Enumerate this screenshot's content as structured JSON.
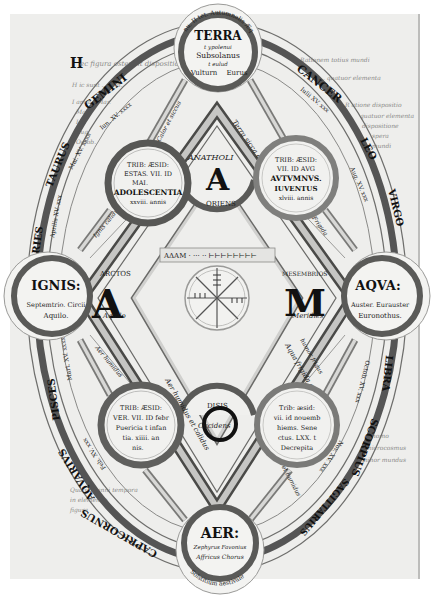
{
  "elements": {
    "terra": {
      "name": "TERRA",
      "lines": [
        "t ypolenui",
        "Subsolanus",
        "t eulud",
        "Vulturn",
        "Eurus"
      ],
      "arc": "nu. II tet. Autumnalis Æquinoctium"
    },
    "ignis": {
      "name": "IGNIS:",
      "lines": [
        "Septemtrio. Circii",
        "Aquilo."
      ],
      "arc": "Ver. Æquinoctium vernale"
    },
    "aqua": {
      "name": "AQVA:",
      "lines": [
        "Auster. Eurauster",
        "Euronothus."
      ],
      "arc": "Solstitium hiemale"
    },
    "aer": {
      "name": "AER:",
      "lines": [
        "Zephyrus Favonius",
        "Affricus Chorus"
      ],
      "arc": "Solstitium aestivale"
    }
  },
  "seasons": {
    "aestas": {
      "lines": [
        "TRIB: ÆSID:",
        "ESTAS. VII. ID",
        "MAI.",
        "ADOLESCENTIA",
        "xxviii. annis"
      ]
    },
    "autumnus": {
      "lines": [
        "TRIB: ÆSID:",
        "VII. ID AVG",
        "AVTVMNVS.",
        "IUVENTUS",
        "xlviii. annis"
      ]
    },
    "ver": {
      "lines": [
        "TRIB: ÆSID:",
        "VER. VII. ID febr",
        "Puericia t infan",
        "tia. xiiii. an",
        "nis."
      ]
    },
    "hiems": {
      "lines": [
        "Trib: æsid:",
        "vii. id nouemb",
        "hiems. Sene",
        "ctus. LXX. t",
        "Decrepita"
      ]
    }
  },
  "center": {
    "anatholi": {
      "letter": "A",
      "word": "ANATHOLI",
      "sub": "ORIENS"
    },
    "arctos": {
      "letter": "A",
      "word": "ARCTOS",
      "sub": "Aquilo"
    },
    "mesembrios": {
      "letter": "M",
      "word": "MESEMBRIOS",
      "sub": "Meridies"
    },
    "disis": {
      "letter": "D",
      "word": "DISIS",
      "sub": "Occidens"
    },
    "notation_label": "ADAM",
    "sides": [
      "Terra sicca et frigida",
      "Ignis calidus et siccus",
      "Aqua frigida et humida",
      "Aer humidus et calidus"
    ]
  },
  "zodiac": {
    "left": [
      "GEMINI",
      "TAURUS",
      "ARIES",
      "PISCES",
      "AQVARIVS",
      "CAPRICORNUS"
    ],
    "right": [
      "CANCER",
      "LEO",
      "VIRGO",
      "LIBRA",
      "SCORPIUS",
      "SAGITTARIUS"
    ]
  },
  "qualities": {
    "ignis_to_aestas": "Ignis calidus",
    "aestas_to_aer": "Calor et siccus",
    "terra_frigida": "Frigida",
    "aqua_humida": "humor frigus",
    "aer_humidus": "Aer humidus",
    "aer_calidus": "Calidus et humidus"
  },
  "margin_text": {
    "top_left_initial": "H",
    "top_left": "ec figura ostendit dispositionem",
    "left_lines": [
      "H ic sunt ... Mai.",
      "I anuar. Mar.",
      "Mai.",
      "Iul.",
      "Aug.",
      "Octob."
    ],
    "top_right": "Rationem totius mundi",
    "right_lines": [
      "H ... quatuor elementa",
      "R atione dispositio",
      "quatuor elementa",
      "dispositione",
      "spera",
      "mundi"
    ],
    "bottom_left": [
      "Quatuor anni tempora",
      "in elementis",
      "figura"
    ],
    "bottom_right": [
      "homo",
      "microcosmus",
      "minor mundus"
    ]
  }
}
